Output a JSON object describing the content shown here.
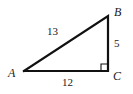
{
  "figure": {
    "kind": "right-triangle-diagram",
    "background_color": "#ffffff",
    "stroke_color": "#111111",
    "text_color": "#1a1a1a",
    "vertices": {
      "A": {
        "label": "A",
        "x": 24,
        "y": 71
      },
      "B": {
        "label": "B",
        "x": 108,
        "y": 16
      },
      "C": {
        "label": "C",
        "x": 108,
        "y": 71
      }
    },
    "sides": {
      "hypotenuse": {
        "label": "13",
        "from": "A",
        "to": "B"
      },
      "vertical": {
        "label": "5",
        "from": "B",
        "to": "C"
      },
      "base": {
        "label": "12",
        "from": "A",
        "to": "C"
      }
    },
    "right_angle": {
      "at": "C",
      "marker": "right-angle-square",
      "size": 7
    }
  }
}
